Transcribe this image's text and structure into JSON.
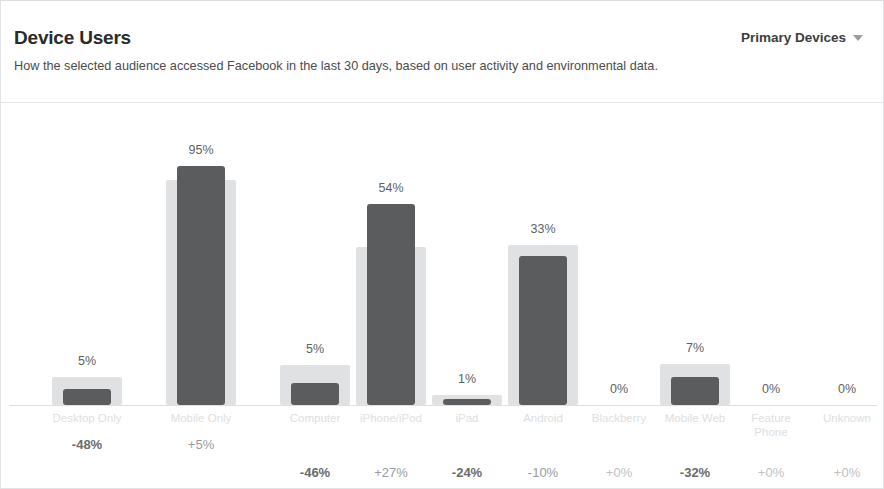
{
  "header": {
    "title": "Device Users",
    "subtitle": "How the selected audience accessed Facebook in the last 30 days, based on user activity and environmental data.",
    "dropdown_label": "Primary Devices",
    "dropdown_icon": "chevron-down-icon"
  },
  "chart_data": {
    "type": "bar",
    "title": "Device Users",
    "subtitle": "How the selected audience accessed Facebook in the last 30 days, based on user activity and environmental data.",
    "xlabel": "",
    "ylabel": "",
    "ylim": [
      0,
      100
    ],
    "grid": false,
    "legend": "none",
    "categories": [
      "Desktop Only",
      "Mobile Only",
      "Computer",
      "iPhone/iPod",
      "iPad",
      "Android",
      "Blackberry",
      "Mobile Web",
      "Feature Phone",
      "Unknown"
    ],
    "series": [
      {
        "name": "Selected audience",
        "values": [
          5,
          95,
          5,
          54,
          1,
          33,
          0,
          7,
          0,
          0
        ]
      },
      {
        "name": "Benchmark (all Facebook)",
        "values": [
          9,
          90,
          9,
          42,
          2,
          37,
          0,
          10,
          0,
          0
        ]
      }
    ],
    "value_labels": [
      "5%",
      "95%",
      "5%",
      "54%",
      "1%",
      "33%",
      "0%",
      "7%",
      "0%",
      "0%"
    ],
    "delta_labels": [
      "-48%",
      "+5%",
      "-46%",
      "+27%",
      "-24%",
      "-10%",
      "+0%",
      "-32%",
      "+0%",
      "+0%"
    ],
    "groups": [
      {
        "name": "Device type",
        "categories": [
          "Desktop Only",
          "Mobile Only"
        ]
      },
      {
        "name": "Platform",
        "categories": [
          "Computer",
          "iPhone/iPod",
          "iPad",
          "Android"
        ]
      },
      {
        "name": "Other",
        "categories": [
          "Blackberry",
          "Mobile Web",
          "Feature Phone",
          "Unknown"
        ]
      }
    ]
  },
  "bars": [
    {
      "label": "Desktop Only",
      "label_wrap": false,
      "pct": "5%",
      "delta": "-48%",
      "delta_style": "bold",
      "value_h": 16,
      "bench_h": 28,
      "center": 86,
      "delta_top": 334
    },
    {
      "label": "Mobile Only",
      "label_wrap": false,
      "pct": "95%",
      "delta": "+5%",
      "delta_style": "mid",
      "value_h": 239,
      "bench_h": 225,
      "center": 200,
      "delta_top": 334
    },
    {
      "label": "Computer",
      "label_wrap": false,
      "pct": "5%",
      "delta": "-46%",
      "delta_style": "bold",
      "value_h": 22,
      "bench_h": 40,
      "center": 314,
      "delta_top": 362
    },
    {
      "label": "iPhone/iPod",
      "label_wrap": false,
      "pct": "54%",
      "delta": "+27%",
      "delta_style": "mid",
      "value_h": 201,
      "bench_h": 158,
      "center": 390,
      "delta_top": 362
    },
    {
      "label": "iPad",
      "label_wrap": false,
      "pct": "1%",
      "delta": "-24%",
      "delta_style": "bold",
      "value_h": 6,
      "bench_h": 10,
      "center": 466,
      "delta_top": 362
    },
    {
      "label": "Android",
      "label_wrap": false,
      "pct": "33%",
      "delta": "-10%",
      "delta_style": "mid",
      "value_h": 149,
      "bench_h": 160,
      "center": 542,
      "delta_top": 362
    },
    {
      "label": "Blackberry",
      "label_wrap": false,
      "pct": "0%",
      "delta": "+0%",
      "delta_style": "faint",
      "value_h": 0,
      "bench_h": 0,
      "center": 618,
      "delta_top": 362
    },
    {
      "label": "Mobile Web",
      "label_wrap": false,
      "pct": "7%",
      "delta": "-32%",
      "delta_style": "bold",
      "value_h": 28,
      "bench_h": 41,
      "center": 694,
      "delta_top": 362
    },
    {
      "label": "Feature Phone",
      "label_wrap": true,
      "pct": "0%",
      "delta": "+0%",
      "delta_style": "faint",
      "value_h": 0,
      "bench_h": 0,
      "center": 770,
      "delta_top": 362
    },
    {
      "label": "Unknown",
      "label_wrap": false,
      "pct": "0%",
      "delta": "+0%",
      "delta_style": "faint",
      "value_h": 0,
      "bench_h": 0,
      "center": 846,
      "delta_top": 362
    }
  ],
  "colors": {
    "value_bar": "#5b5c5e",
    "benchmark_bar": "#e0e1e3",
    "panel_border": "#e2e3e5",
    "baseline": "#dedfe1",
    "title_text": "#2b2b2b",
    "subtitle_text": "#4b4c4e",
    "category_text": "#dddee0"
  }
}
